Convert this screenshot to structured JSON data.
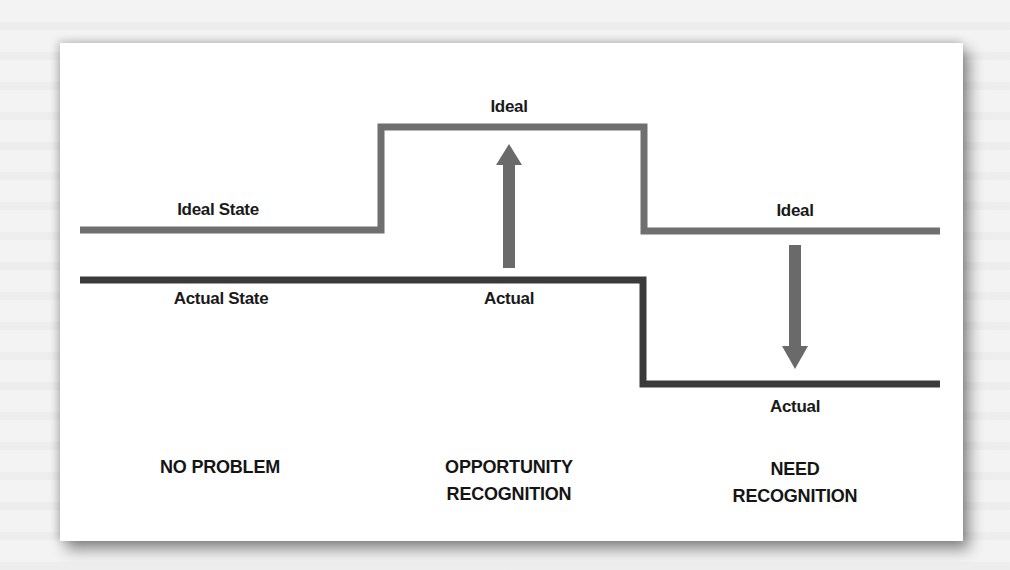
{
  "diagram": {
    "colors": {
      "ideal_line": "#6f6f6f",
      "actual_line": "#3a3a3a",
      "arrow": "#6a6a6a",
      "text": "#1a1a1a",
      "card_background": "#ffffff"
    },
    "lines": {
      "ideal_state_label": "Ideal State",
      "actual_state_label": "Actual State"
    },
    "scenarios": [
      {
        "id": "no-problem",
        "caption_line1": "NO PROBLEM",
        "caption_line2": ""
      },
      {
        "id": "opportunity-recognition",
        "ideal_label": "Ideal",
        "actual_label": "Actual",
        "arrow_direction": "up",
        "caption_line1": "OPPORTUNITY",
        "caption_line2": "RECOGNITION"
      },
      {
        "id": "need-recognition",
        "ideal_label": "Ideal",
        "actual_label": "Actual",
        "arrow_direction": "down",
        "caption_line1": "NEED",
        "caption_line2": "RECOGNITION"
      }
    ]
  }
}
